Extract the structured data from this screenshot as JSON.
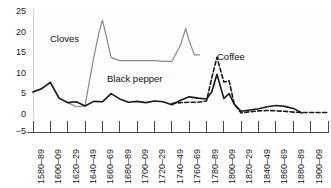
{
  "chart_data": {
    "type": "line",
    "title": "",
    "subtitle": "",
    "xlabel": "",
    "ylabel": "",
    "grid": true,
    "legend_position": "inline-annotations",
    "xlim_categories": 18,
    "ylim": [
      -5,
      25
    ],
    "yticks": [
      -5,
      0,
      5,
      10,
      15,
      20,
      25
    ],
    "ytick_labels": [
      "−5",
      "0",
      "5",
      "10",
      "15",
      "20",
      "25"
    ],
    "categories": [
      "1580–89",
      "1600–09",
      "1620–29",
      "1640–49",
      "1660–69",
      "1680–89",
      "1700–09",
      "1720–29",
      "1740–49",
      "1760–69",
      "1780–89",
      "1800–09",
      "1820–29",
      "1840–49",
      "1860–69",
      "1880–89",
      "1900–09",
      "1920–29"
    ],
    "series": [
      {
        "name": "Cloves",
        "style": "solid",
        "color": "#8a8a8a",
        "x": [
          0,
          0.5,
          1.0,
          1.5,
          2.0,
          2.5,
          3.0,
          3.2,
          3.5,
          3.8,
          4.0,
          4.2,
          4.5,
          5.0,
          5.5,
          6.0,
          6.5,
          7.0,
          7.5,
          8.0,
          8.5,
          8.8,
          9.0,
          9.3,
          9.6
        ],
        "values": [
          5.6,
          6.4,
          7.9,
          4.1,
          3.0,
          2.0,
          2.2,
          7.0,
          14.0,
          20.0,
          23.0,
          19.5,
          14.0,
          13.2,
          13.2,
          13.2,
          13.2,
          13.2,
          13.0,
          13.0,
          17.0,
          21.0,
          18.0,
          14.6,
          14.6
        ]
      },
      {
        "name": "Black pepper",
        "style": "solid",
        "color": "#1a1a1a",
        "x": [
          0,
          0.5,
          1.0,
          1.5,
          2.0,
          2.5,
          3.0,
          3.5,
          4.0,
          4.5,
          5.0,
          5.5,
          6.0,
          6.5,
          7.0,
          7.5,
          8.0,
          8.5,
          9.0,
          9.5,
          10.0,
          10.3,
          10.6,
          11.0,
          11.3,
          11.6,
          12.0,
          12.5,
          13.0,
          13.5,
          14.0,
          14.5,
          15.0,
          15.5
        ],
        "values": [
          5.6,
          6.4,
          7.9,
          4.1,
          3.0,
          3.2,
          2.2,
          3.3,
          3.2,
          5.2,
          3.9,
          3.1,
          3.3,
          3.0,
          3.4,
          3.2,
          2.5,
          3.6,
          4.4,
          4.1,
          3.9,
          5.6,
          9.9,
          4.0,
          5.2,
          2.6,
          0.9,
          1.2,
          1.5,
          2.0,
          2.3,
          2.1,
          1.6,
          0.5
        ]
      },
      {
        "name": "Coffee",
        "style": "dashed",
        "color": "#1a1a1a",
        "x": [
          8.0,
          8.5,
          9.0,
          9.5,
          10.0,
          10.3,
          10.6,
          11.0,
          11.3,
          11.6,
          12.0,
          12.5,
          13.0,
          13.5,
          14.0,
          14.5,
          15.0,
          15.5,
          16.0,
          16.5,
          17.0
        ],
        "values": [
          2.8,
          3.0,
          3.1,
          3.1,
          3.4,
          9.0,
          14.0,
          8.0,
          8.3,
          2.6,
          0.5,
          0.8,
          1.0,
          1.1,
          1.0,
          0.9,
          0.7,
          0.6,
          0.6,
          0.6,
          0.6
        ]
      }
    ],
    "annotations": [
      {
        "text": "Cloves",
        "x_px": 50,
        "y_px": 33
      },
      {
        "text": "Black pepper",
        "x_px": 107,
        "y_px": 73
      },
      {
        "text": "Coffee",
        "x_px": 217,
        "y_px": 51
      }
    ]
  }
}
